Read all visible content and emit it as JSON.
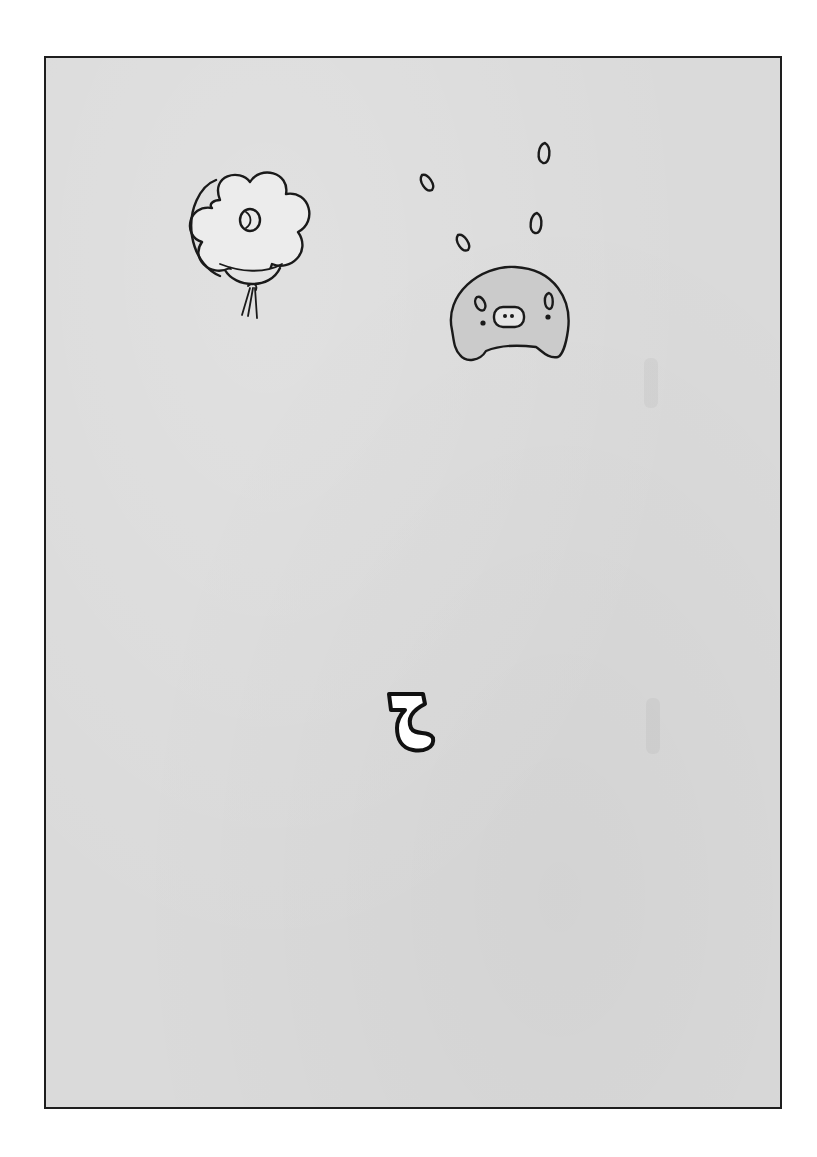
{
  "page": {
    "panel": {
      "background": "#dadada",
      "border": "#1e1e1e"
    },
    "illustrations": [
      {
        "name": "flower-balloon",
        "description": "cloud/flower-shaped balloon with a circle mark and tied strings"
      },
      {
        "name": "blob-creature",
        "description": "round blob character with pig-like snout, shaded gray"
      },
      {
        "name": "sweat-drops",
        "description": "five teardrop marks above the blob creature",
        "count": 5
      },
      {
        "name": "glyph-mark",
        "description": "white outlined ζ-shaped glyph",
        "text": "ζ"
      }
    ]
  }
}
